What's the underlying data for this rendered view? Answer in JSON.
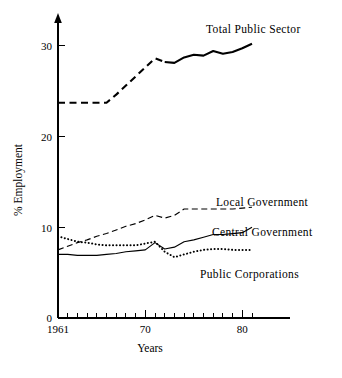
{
  "chart_data": {
    "type": "line",
    "title": "",
    "xlabel": "Years",
    "ylabel": "% Employment",
    "xlim": [
      1961,
      1982
    ],
    "ylim": [
      0,
      32
    ],
    "grid": false,
    "legend_position": "inline-labels",
    "y_ticks": [
      "0",
      "10",
      "20",
      "30"
    ],
    "y_tick_values": [
      0,
      10,
      20,
      30
    ],
    "x_ticks": [
      "1961",
      "70",
      "80"
    ],
    "x_tick_values": [
      1961,
      1970,
      1980
    ],
    "x_minor_tick_values": [
      1962,
      1963,
      1964,
      1965,
      1966,
      1967,
      1968,
      1969,
      1971,
      1972,
      1973,
      1974,
      1975,
      1976,
      1977,
      1978,
      1979,
      1981
    ],
    "x": [
      1961,
      1962,
      1963,
      1964,
      1965,
      1966,
      1967,
      1968,
      1969,
      1970,
      1971,
      1972,
      1973,
      1974,
      1975,
      1976,
      1977,
      1978,
      1979,
      1980,
      1981
    ],
    "series": [
      {
        "name": "Total Public Sector",
        "style": "dashed-then-solid",
        "label": "Total Public Sector",
        "values": [
          23.7,
          23.7,
          23.7,
          23.7,
          23.7,
          23.7,
          24.6,
          25.6,
          26.6,
          27.6,
          28.6,
          28.2,
          28.1,
          28.7,
          29.0,
          28.9,
          29.4,
          29.1,
          29.3,
          29.7,
          30.2
        ]
      },
      {
        "name": "Local Government",
        "style": "dashed",
        "label": "Local Government",
        "values": [
          7.5,
          7.9,
          8.3,
          8.6,
          9.0,
          9.3,
          9.7,
          10.1,
          10.4,
          10.8,
          11.3,
          11.0,
          11.3,
          12.0,
          12.0,
          12.0,
          12.0,
          12.0,
          12.0,
          12.1,
          12.2
        ]
      },
      {
        "name": "Central Government",
        "style": "solid",
        "label": "Central Government",
        "values": [
          7.0,
          7.0,
          6.9,
          6.9,
          6.9,
          7.0,
          7.1,
          7.3,
          7.4,
          7.5,
          8.3,
          7.6,
          7.8,
          8.4,
          8.6,
          8.9,
          9.2,
          9.2,
          9.3,
          9.4,
          10.0
        ]
      },
      {
        "name": "Public Corporations",
        "style": "dotted",
        "label": "Public Corporations",
        "values": [
          9.0,
          8.7,
          8.4,
          8.3,
          8.1,
          8.0,
          8.0,
          8.0,
          8.0,
          8.2,
          8.4,
          7.3,
          6.7,
          7.0,
          7.3,
          7.5,
          7.6,
          7.6,
          7.5,
          7.5,
          7.5
        ]
      }
    ],
    "annotations": [
      {
        "text": "Total Public Sector",
        "x": 1980,
        "y": 31.4
      },
      {
        "text": "Local Government",
        "x": 1978,
        "y": 14.0
      },
      {
        "text": "Central Government",
        "x": 1978,
        "y": 11.0
      },
      {
        "text": "Public Corporations",
        "x": 1978,
        "y": 6.1
      }
    ]
  },
  "axes": {
    "y_title": "% Employment",
    "x_title": "Years",
    "y_tick_labels": [
      "0",
      "10",
      "20",
      "30"
    ],
    "x_tick_labels": [
      "1961",
      "70",
      "80"
    ]
  },
  "labels": {
    "total_public_sector": "Total Public Sector",
    "local_government": "Local Government",
    "central_government": "Central Government",
    "public_corporations": "Public Corporations"
  },
  "colors": {
    "ink": "#000000",
    "background": "#ffffff"
  }
}
